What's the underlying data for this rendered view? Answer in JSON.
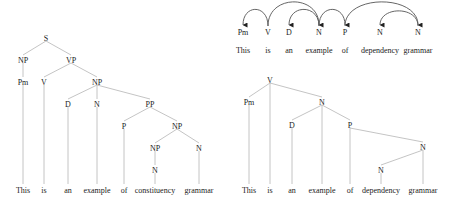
{
  "colors": {
    "edge": "#bdbdbd",
    "arc": "#555555",
    "text": "#222222",
    "background": "#ffffff"
  },
  "constituency_tree": {
    "nodes": [
      {
        "id": "S",
        "label": "S",
        "x": 46,
        "y": 38
      },
      {
        "id": "NP1",
        "label": "NP",
        "x": 23,
        "y": 60
      },
      {
        "id": "VP",
        "label": "VP",
        "x": 71,
        "y": 60
      },
      {
        "id": "Pm",
        "label": "Pm",
        "x": 23,
        "y": 82
      },
      {
        "id": "V",
        "label": "V",
        "x": 44,
        "y": 82
      },
      {
        "id": "NP2",
        "label": "NP",
        "x": 97,
        "y": 82
      },
      {
        "id": "D",
        "label": "D",
        "x": 68,
        "y": 104
      },
      {
        "id": "N1",
        "label": "N",
        "x": 97,
        "y": 104
      },
      {
        "id": "PP",
        "label": "PP",
        "x": 150,
        "y": 104
      },
      {
        "id": "P",
        "label": "P",
        "x": 124,
        "y": 126
      },
      {
        "id": "NP3",
        "label": "NP",
        "x": 177,
        "y": 126
      },
      {
        "id": "NP4",
        "label": "NP",
        "x": 155,
        "y": 148
      },
      {
        "id": "N2",
        "label": "N",
        "x": 199,
        "y": 148
      },
      {
        "id": "N3",
        "label": "N",
        "x": 155,
        "y": 170
      }
    ],
    "words": [
      {
        "label": "This",
        "x": 23
      },
      {
        "label": "is",
        "x": 44
      },
      {
        "label": "an",
        "x": 68
      },
      {
        "label": "example",
        "x": 97
      },
      {
        "label": "of",
        "x": 124
      },
      {
        "label": "constituency",
        "x": 155
      },
      {
        "label": "grammar",
        "x": 199
      }
    ],
    "word_y": 190
  },
  "dependency_arcs": {
    "tags": [
      {
        "label": "Pm",
        "x": 243
      },
      {
        "label": "V",
        "x": 268
      },
      {
        "label": "D",
        "x": 289
      },
      {
        "label": "N",
        "x": 319
      },
      {
        "label": "P",
        "x": 345
      },
      {
        "label": "N",
        "x": 380
      },
      {
        "label": "N",
        "x": 418
      }
    ],
    "words": [
      {
        "label": "This",
        "x": 243
      },
      {
        "label": "is",
        "x": 268
      },
      {
        "label": "an",
        "x": 289
      },
      {
        "label": "example",
        "x": 319
      },
      {
        "label": "of",
        "x": 345
      },
      {
        "label": "dependency",
        "x": 380
      },
      {
        "label": "grammar",
        "x": 418
      }
    ],
    "tag_y": 32,
    "word_y": 50,
    "arcs": [
      {
        "from": "is",
        "to": "This"
      },
      {
        "from": "is",
        "to": "example"
      },
      {
        "from": "example",
        "to": "an"
      },
      {
        "from": "example",
        "to": "of"
      },
      {
        "from": "of",
        "to": "grammar"
      },
      {
        "from": "grammar",
        "to": "dependency"
      }
    ]
  },
  "dependency_tree": {
    "nodes": [
      {
        "id": "V",
        "label": "V",
        "x": 270,
        "y": 80
      },
      {
        "id": "Pm",
        "label": "Pm",
        "x": 249,
        "y": 102
      },
      {
        "id": "N1",
        "label": "N",
        "x": 322,
        "y": 102
      },
      {
        "id": "D",
        "label": "D",
        "x": 292,
        "y": 125
      },
      {
        "id": "P",
        "label": "P",
        "x": 350,
        "y": 125
      },
      {
        "id": "N2",
        "label": "N",
        "x": 423,
        "y": 147
      },
      {
        "id": "N3",
        "label": "N",
        "x": 381,
        "y": 170
      }
    ],
    "words": [
      {
        "label": "This",
        "x": 249
      },
      {
        "label": "is",
        "x": 270
      },
      {
        "label": "an",
        "x": 292
      },
      {
        "label": "example",
        "x": 322
      },
      {
        "label": "of",
        "x": 350
      },
      {
        "label": "dependency",
        "x": 381
      },
      {
        "label": "grammar",
        "x": 423
      }
    ],
    "word_y": 190
  }
}
